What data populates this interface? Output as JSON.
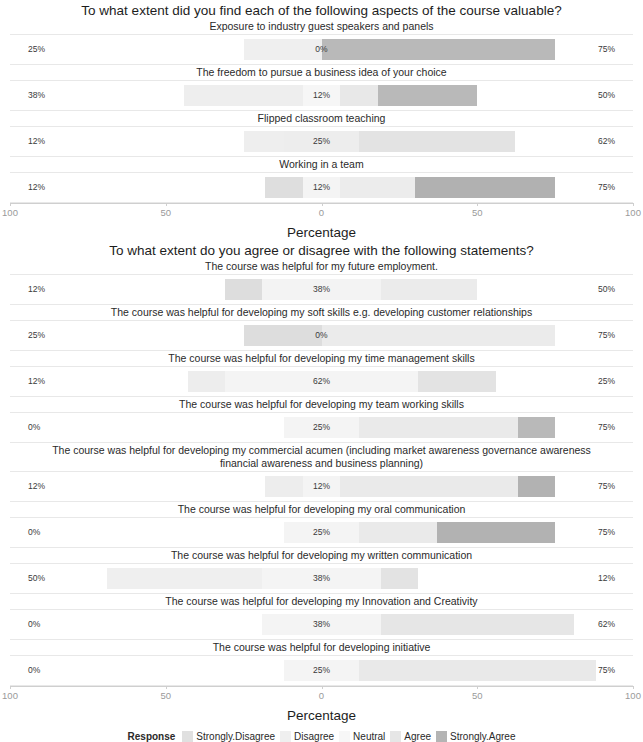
{
  "chart_data": {
    "type": "bar",
    "subtype": "diverging-stacked-likert",
    "axis_title": "Percentage",
    "x_ticks": [
      "100",
      "50",
      "0",
      "50",
      "100"
    ],
    "x_tick_positions": [
      -100,
      -50,
      0,
      50,
      100
    ],
    "xlim": [
      -100,
      100
    ],
    "grid": false,
    "legend": {
      "title": "Response",
      "position": "bottom",
      "entries": [
        {
          "label": "Strongly.Disagree",
          "color": "#e0e0e0"
        },
        {
          "label": "Disagree",
          "color": "#efefef"
        },
        {
          "label": "Neutral",
          "color": "#f7f7f7"
        },
        {
          "label": "Agree",
          "color": "#e6e6e6"
        },
        {
          "label": "Strongly.Agree",
          "color": "#b4b4b4"
        }
      ]
    },
    "panels": [
      {
        "title": "To what extent did you find each of the following aspects of the course valuable?",
        "rows": [
          {
            "label": "Exposure to industry guest speakers and panels",
            "left_pct": "25%",
            "mid_pct": "0%",
            "right_pct": "75%",
            "values": {
              "strongly_disagree": 0,
              "disagree": 25,
              "neutral": 0,
              "agree": 0,
              "strongly_agree": 75
            },
            "segments": [
              {
                "key": "disagree",
                "start": -25,
                "end": 0,
                "color": "#efefef"
              },
              {
                "key": "strongly_agree",
                "start": 0,
                "end": 75,
                "color": "#b9b9b9"
              }
            ]
          },
          {
            "label": "The freedom to pursue a business idea of your choice",
            "left_pct": "38%",
            "mid_pct": "12%",
            "right_pct": "50%",
            "values": {
              "strongly_disagree": 0,
              "disagree": 38,
              "neutral": 12,
              "agree": 12,
              "strongly_agree": 38
            },
            "segments": [
              {
                "key": "disagree",
                "start": -44,
                "end": -6,
                "color": "#eeeeee"
              },
              {
                "key": "neutral",
                "start": -6,
                "end": 6,
                "color": "#f6f6f6"
              },
              {
                "key": "agree",
                "start": 6,
                "end": 18,
                "color": "#e8e8e8"
              },
              {
                "key": "strongly_agree",
                "start": 18,
                "end": 50,
                "color": "#b9b9b9"
              }
            ]
          },
          {
            "label": "Flipped classroom teaching",
            "left_pct": "12%",
            "mid_pct": "25%",
            "right_pct": "62%",
            "values": {
              "strongly_disagree": 0,
              "disagree": 12,
              "neutral": 25,
              "agree": 50,
              "strongly_agree": 12
            },
            "segments": [
              {
                "key": "disagree",
                "start": -25,
                "end": -12,
                "color": "#eeeeee"
              },
              {
                "key": "neutral",
                "start": -12,
                "end": 12,
                "color": "#ededed"
              },
              {
                "key": "agree",
                "start": 12,
                "end": 62,
                "color": "#e3e3e3"
              },
              {
                "key": "strongly_agree",
                "start": 62,
                "end": 62,
                "color": "#b9b9b9"
              }
            ]
          },
          {
            "label": "Working in a team",
            "left_pct": "12%",
            "mid_pct": "12%",
            "right_pct": "75%",
            "values": {
              "strongly_disagree": 0,
              "disagree": 12,
              "neutral": 12,
              "agree": 12,
              "strongly_agree": 63
            },
            "segments": [
              {
                "key": "disagree",
                "start": -18,
                "end": -6,
                "color": "#dedede"
              },
              {
                "key": "neutral",
                "start": -6,
                "end": 6,
                "color": "#f4f4f4"
              },
              {
                "key": "agree",
                "start": 6,
                "end": 30,
                "color": "#ececec"
              },
              {
                "key": "strongly_agree",
                "start": 30,
                "end": 75,
                "color": "#b1b1b1"
              }
            ]
          }
        ]
      },
      {
        "title": "To what extent do you agree or disagree with the following statements?",
        "rows": [
          {
            "label": "The course was helpful for my future employment.",
            "left_pct": "12%",
            "mid_pct": "38%",
            "right_pct": "50%",
            "values": {
              "strongly_disagree": 0,
              "disagree": 12,
              "neutral": 38,
              "agree": 38,
              "strongly_agree": 12
            },
            "segments": [
              {
                "key": "disagree",
                "start": -31,
                "end": -19,
                "color": "#dddddd"
              },
              {
                "key": "neutral",
                "start": -19,
                "end": 19,
                "color": "#f3f3f3"
              },
              {
                "key": "agree",
                "start": 19,
                "end": 50,
                "color": "#ebebeb"
              },
              {
                "key": "strongly_agree",
                "start": 50,
                "end": 50,
                "color": "#b1b1b1"
              }
            ]
          },
          {
            "label": "The course was helpful for developing my soft skills e.g. developing customer relationships",
            "left_pct": "25%",
            "mid_pct": "0%",
            "right_pct": "75%",
            "values": {
              "strongly_disagree": 0,
              "disagree": 25,
              "neutral": 0,
              "agree": 75,
              "strongly_agree": 0
            },
            "segments": [
              {
                "key": "disagree",
                "start": -25,
                "end": 0,
                "color": "#dddddd"
              },
              {
                "key": "agree",
                "start": 0,
                "end": 75,
                "color": "#ebebeb"
              }
            ]
          },
          {
            "label": "The course was helpful for developing my time management skills",
            "left_pct": "12%",
            "mid_pct": "62%",
            "right_pct": "25%",
            "values": {
              "strongly_disagree": 0,
              "disagree": 12,
              "neutral": 62,
              "agree": 25,
              "strongly_agree": 0
            },
            "segments": [
              {
                "key": "disagree",
                "start": -43,
                "end": -31,
                "color": "#ededed"
              },
              {
                "key": "neutral",
                "start": -31,
                "end": 31,
                "color": "#f4f4f4"
              },
              {
                "key": "agree",
                "start": 31,
                "end": 56,
                "color": "#e3e3e3"
              }
            ]
          },
          {
            "label": "The course was helpful for developing my team working skills",
            "left_pct": "0%",
            "mid_pct": "25%",
            "right_pct": "75%",
            "values": {
              "strongly_disagree": 0,
              "disagree": 0,
              "neutral": 25,
              "agree": 62,
              "strongly_agree": 13
            },
            "segments": [
              {
                "key": "neutral",
                "start": -12,
                "end": 12,
                "color": "#f4f4f4"
              },
              {
                "key": "agree",
                "start": 12,
                "end": 63,
                "color": "#eaeaea"
              },
              {
                "key": "strongly_agree",
                "start": 63,
                "end": 75,
                "color": "#b9b9b9"
              }
            ]
          },
          {
            "label": "The course was helpful for developing my commercial acumen (including market awareness governance awareness financial awareness and business planning)",
            "left_pct": "12%",
            "mid_pct": "12%",
            "right_pct": "75%",
            "values": {
              "strongly_disagree": 0,
              "disagree": 12,
              "neutral": 12,
              "agree": 63,
              "strongly_agree": 12
            },
            "segments": [
              {
                "key": "disagree",
                "start": -18,
                "end": -6,
                "color": "#ededed"
              },
              {
                "key": "neutral",
                "start": -6,
                "end": 6,
                "color": "#f4f4f4"
              },
              {
                "key": "agree",
                "start": 6,
                "end": 63,
                "color": "#eaeaea"
              },
              {
                "key": "strongly_agree",
                "start": 63,
                "end": 75,
                "color": "#b2b2b2"
              }
            ]
          },
          {
            "label": "The course was helpful for developing my oral communication",
            "left_pct": "0%",
            "mid_pct": "25%",
            "right_pct": "75%",
            "values": {
              "strongly_disagree": 0,
              "disagree": 0,
              "neutral": 25,
              "agree": 37,
              "strongly_agree": 38
            },
            "segments": [
              {
                "key": "neutral",
                "start": -12,
                "end": 12,
                "color": "#f4f4f4"
              },
              {
                "key": "agree",
                "start": 12,
                "end": 37,
                "color": "#eaeaea"
              },
              {
                "key": "strongly_agree",
                "start": 37,
                "end": 75,
                "color": "#b2b2b2"
              }
            ]
          },
          {
            "label": "The course was helpful for developing my written communication",
            "left_pct": "50%",
            "mid_pct": "38%",
            "right_pct": "12%",
            "values": {
              "strongly_disagree": 0,
              "disagree": 50,
              "neutral": 38,
              "agree": 12,
              "strongly_agree": 0
            },
            "segments": [
              {
                "key": "disagree",
                "start": -69,
                "end": -19,
                "color": "#efefef"
              },
              {
                "key": "neutral",
                "start": -19,
                "end": 19,
                "color": "#f4f4f4"
              },
              {
                "key": "agree",
                "start": 19,
                "end": 31,
                "color": "#e3e3e3"
              }
            ]
          },
          {
            "label": "The course was helpful for developing my Innovation and Creativity",
            "left_pct": "0%",
            "mid_pct": "38%",
            "right_pct": "62%",
            "values": {
              "strongly_disagree": 0,
              "disagree": 0,
              "neutral": 38,
              "agree": 62,
              "strongly_agree": 0
            },
            "segments": [
              {
                "key": "neutral",
                "start": -19,
                "end": 19,
                "color": "#f4f4f4"
              },
              {
                "key": "agree",
                "start": 19,
                "end": 81,
                "color": "#e6e6e6"
              }
            ]
          },
          {
            "label": "The course was helpful for developing initiative",
            "left_pct": "0%",
            "mid_pct": "25%",
            "right_pct": "75%",
            "values": {
              "strongly_disagree": 0,
              "disagree": 0,
              "neutral": 25,
              "agree": 75,
              "strongly_agree": 0
            },
            "segments": [
              {
                "key": "neutral",
                "start": -12,
                "end": 12,
                "color": "#f4f4f4"
              },
              {
                "key": "agree",
                "start": 12,
                "end": 88,
                "color": "#e9e9e9"
              }
            ]
          }
        ]
      }
    ]
  }
}
